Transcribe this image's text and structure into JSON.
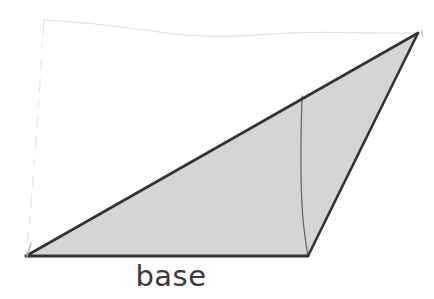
{
  "figure": {
    "kind": "geometry-diagram",
    "background_color": "#ffffff",
    "labels": {
      "base": "base"
    },
    "colors": {
      "fill": "#d5d5d5",
      "outline": "#333333",
      "height_line": "#6b6b6b",
      "guide_line": "#e3e3e3",
      "label_text": "#3a3a3a"
    },
    "geometry": {
      "triangle_vertices": [
        {
          "name": "bottom-left",
          "x": 26,
          "y": 256
        },
        {
          "name": "bottom-right",
          "x": 308,
          "y": 256
        },
        {
          "name": "apex",
          "x": 418,
          "y": 33
        }
      ],
      "base_segment": {
        "x1": 26,
        "y1": 256,
        "x2": 308,
        "y2": 256
      },
      "height_segment": {
        "x1": 302,
        "y1": 96,
        "x2": 308,
        "y2": 256
      },
      "guide_vertical": {
        "x1": 44,
        "y1": 20,
        "x2": 26,
        "y2": 255
      },
      "guide_horizontal": {
        "x1": 44,
        "y1": 20,
        "x2": 418,
        "y2": 33
      },
      "outline_width": 2.4,
      "height_line_width": 1.3,
      "guide_line_width": 1.2
    }
  }
}
